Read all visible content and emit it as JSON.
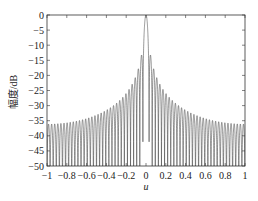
{
  "chart_data": {
    "type": "line",
    "title": "",
    "xlabel": "u",
    "ylabel": "幅度/dB",
    "xlim": [
      -1,
      1
    ],
    "ylim": [
      -50,
      0
    ],
    "xticks": [
      -1,
      -0.8,
      -0.6,
      -0.4,
      -0.2,
      0,
      0.2,
      0.4,
      0.6,
      0.8,
      1
    ],
    "xtick_labels": [
      "-1",
      "-0.8",
      "-0.6",
      "-0.4",
      "-0.2",
      "0",
      "0.2",
      "0.4",
      "0.6",
      "0.8",
      "1"
    ],
    "yticks": [
      0,
      -5,
      -10,
      -15,
      -20,
      -25,
      -30,
      -35,
      -40,
      -45,
      -50
    ],
    "ytick_labels": [
      "0",
      "-5",
      "-10",
      "-15",
      "-20",
      "-25",
      "-30",
      "-35",
      "-40",
      "-45",
      "-50"
    ],
    "grid": false,
    "legend": null,
    "series": [
      {
        "name": "array pattern",
        "description": "Uniform-array sinc-like beam pattern, main lobe peak 0 dB at u=0, first sidelobe approx -13.3 dB, sidelobe envelope decaying to approx -40 dB at u=±1, nulls clipped at -50 dB",
        "peak": {
          "u": 0,
          "dB": 0
        },
        "first_sidelobe_dB": -13.3,
        "envelope": [
          {
            "u": 0.03,
            "dB": -13.3
          },
          {
            "u": 0.1,
            "dB": -18
          },
          {
            "u": 0.2,
            "dB": -25
          },
          {
            "u": 0.4,
            "dB": -32
          },
          {
            "u": 0.6,
            "dB": -36
          },
          {
            "u": 0.8,
            "dB": -38.5
          },
          {
            "u": 1.0,
            "dB": -40
          }
        ],
        "color": "#333333"
      }
    ]
  }
}
